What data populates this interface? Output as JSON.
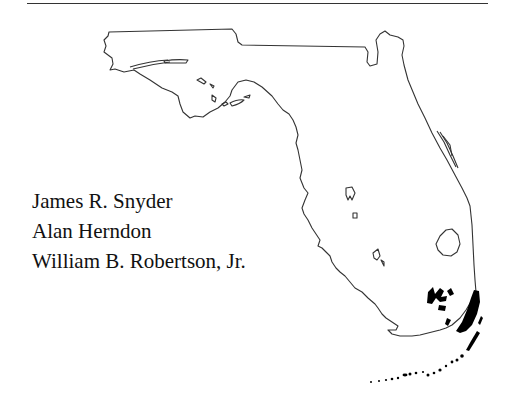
{
  "page": {
    "figure": "Florida state outline map with shaded southern regions",
    "authors": [
      "James R. Snyder",
      "Alan Herndon",
      "William B. Robertson, Jr."
    ]
  },
  "colors": {
    "outline": "#333333",
    "fill": "#000000",
    "text": "#111111",
    "background": "#ffffff"
  }
}
